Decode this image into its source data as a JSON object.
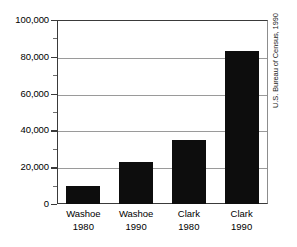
{
  "chart_data": {
    "type": "bar",
    "title": "",
    "xlabel": "",
    "ylabel": "",
    "categories": [
      "Washoe 1980",
      "Washoe 1990",
      "Clark 1980",
      "Clark 1990"
    ],
    "category_lines": [
      {
        "name": "Washoe",
        "year": "1980"
      },
      {
        "name": "Washoe",
        "year": "1990"
      },
      {
        "name": "Clark",
        "year": "1980"
      },
      {
        "name": "Clark",
        "year": "1990"
      }
    ],
    "values": [
      10000,
      23000,
      35000,
      83000
    ],
    "ylim": [
      0,
      100000
    ],
    "yticks": [
      0,
      20000,
      40000,
      60000,
      80000,
      100000
    ],
    "ytick_labels": [
      "0",
      "20,000",
      "40,000",
      "60,000",
      "80,000",
      "100,000"
    ],
    "yminor_ticks": [
      10000,
      30000,
      50000,
      70000,
      90000
    ],
    "grid": true,
    "grid_axis": "y",
    "legend": "none",
    "bar_color": "#0d0d0d",
    "grid_color": "#9a9a9a",
    "axis_color": "#3a3a3a",
    "annotations": [
      "U.S. Bureau of Census, 1990"
    ]
  },
  "source_note": "U.S. Bureau of Census, 1990"
}
